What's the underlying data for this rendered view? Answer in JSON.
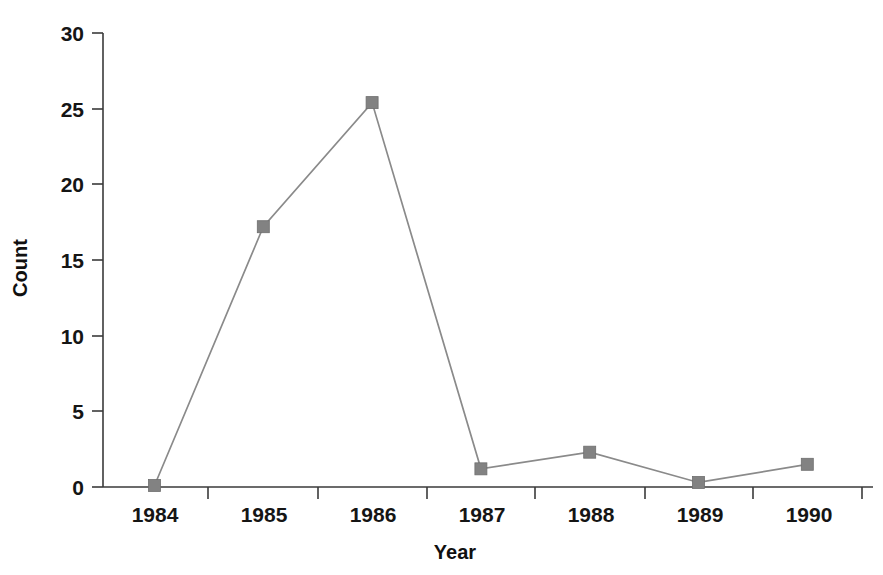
{
  "chart_data": {
    "type": "line",
    "title": "",
    "subtitle": "",
    "xlabel": "Year",
    "ylabel": "Count",
    "categories": [
      "1984",
      "1985",
      "1986",
      "1987",
      "1988",
      "1989",
      "1990"
    ],
    "x": [
      1984,
      1985,
      1986,
      1987,
      1988,
      1989,
      1990
    ],
    "values": [
      0.1,
      17.2,
      25.4,
      1.2,
      2.3,
      0.3,
      1.5
    ],
    "series": [
      {
        "name": "Count",
        "values": [
          0.1,
          17.2,
          25.4,
          1.2,
          2.3,
          0.3,
          1.5
        ],
        "line_color": "#8a8a8a",
        "marker": "square",
        "marker_color": "#828282"
      }
    ],
    "ylim": [
      0,
      30
    ],
    "yticks": [
      0,
      5,
      10,
      15,
      20,
      25,
      30
    ],
    "ytick_labels": [
      "0",
      "5",
      "10",
      "15",
      "20",
      "25",
      "30"
    ],
    "xtick_labels": [
      "1984",
      "1985",
      "1986",
      "1987",
      "1988",
      "1989",
      "1990"
    ],
    "grid": false,
    "legend": false,
    "legend_position": "none",
    "annotations": [],
    "background_color": "#ffffff",
    "axis_color": "#3a3a3a"
  },
  "axes": {
    "y_axis_title": "Count",
    "x_axis_title": "Year",
    "y_tick_values": [
      "0",
      "5",
      "10",
      "15",
      "20",
      "25",
      "30"
    ],
    "x_tick_values": [
      "1984",
      "1985",
      "1986",
      "1987",
      "1988",
      "1989",
      "1990"
    ]
  }
}
